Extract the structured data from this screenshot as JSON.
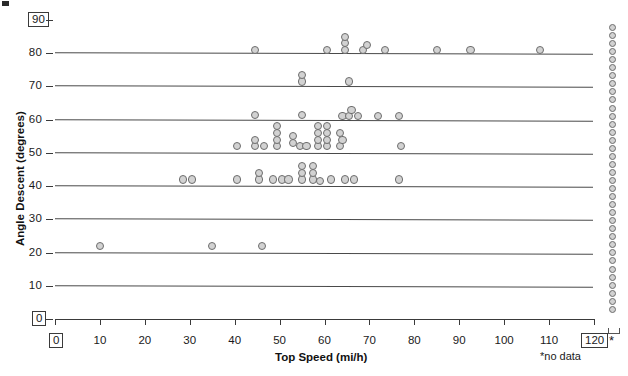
{
  "chart_data": {
    "type": "scatter",
    "title": "",
    "xlabel": "Top Speed (mi/h)",
    "ylabel": "Angle Descent (degrees)",
    "xlim": [
      0,
      120
    ],
    "ylim": [
      0,
      90
    ],
    "xticks": [
      0,
      10,
      20,
      30,
      40,
      50,
      60,
      70,
      80,
      90,
      100,
      110,
      120
    ],
    "yticks": [
      0,
      10,
      20,
      30,
      40,
      50,
      60,
      70,
      80,
      90
    ],
    "grid": "horizontal",
    "legend": "none",
    "annotations": [
      "*no data"
    ],
    "boxed_ticks": {
      "x": [
        0,
        120
      ],
      "y": [
        0,
        90
      ]
    },
    "marker": {
      "shape": "circle",
      "fill": "#d2d2d2",
      "edge": "#6d6d6d"
    },
    "points": [
      {
        "x": 10,
        "y": 22
      },
      {
        "x": 35,
        "y": 22
      },
      {
        "x": 46,
        "y": 22
      },
      {
        "x": 28.5,
        "y": 42
      },
      {
        "x": 30.5,
        "y": 42
      },
      {
        "x": 40.5,
        "y": 42
      },
      {
        "x": 45.5,
        "y": 42
      },
      {
        "x": 45.5,
        "y": 44
      },
      {
        "x": 48.5,
        "y": 42
      },
      {
        "x": 50.5,
        "y": 42
      },
      {
        "x": 52,
        "y": 42
      },
      {
        "x": 55,
        "y": 42
      },
      {
        "x": 55,
        "y": 44
      },
      {
        "x": 55,
        "y": 46
      },
      {
        "x": 57.5,
        "y": 42
      },
      {
        "x": 57.5,
        "y": 44
      },
      {
        "x": 57.5,
        "y": 46
      },
      {
        "x": 59,
        "y": 41.5
      },
      {
        "x": 61.5,
        "y": 42
      },
      {
        "x": 64.5,
        "y": 42
      },
      {
        "x": 66.5,
        "y": 42
      },
      {
        "x": 76.5,
        "y": 42
      },
      {
        "x": 40.5,
        "y": 52
      },
      {
        "x": 44.5,
        "y": 52
      },
      {
        "x": 44.5,
        "y": 54
      },
      {
        "x": 46.5,
        "y": 52
      },
      {
        "x": 49.5,
        "y": 52
      },
      {
        "x": 49.5,
        "y": 54
      },
      {
        "x": 49.5,
        "y": 56
      },
      {
        "x": 49.5,
        "y": 58
      },
      {
        "x": 53,
        "y": 53
      },
      {
        "x": 53,
        "y": 55
      },
      {
        "x": 54.5,
        "y": 52
      },
      {
        "x": 56,
        "y": 52
      },
      {
        "x": 58.5,
        "y": 52
      },
      {
        "x": 58.5,
        "y": 54
      },
      {
        "x": 58.5,
        "y": 56
      },
      {
        "x": 58.5,
        "y": 58
      },
      {
        "x": 60.5,
        "y": 52
      },
      {
        "x": 60.5,
        "y": 54
      },
      {
        "x": 60.5,
        "y": 56
      },
      {
        "x": 60.5,
        "y": 58
      },
      {
        "x": 63.5,
        "y": 52
      },
      {
        "x": 64,
        "y": 54
      },
      {
        "x": 63.5,
        "y": 56
      },
      {
        "x": 77,
        "y": 52
      },
      {
        "x": 44.5,
        "y": 61.5
      },
      {
        "x": 55,
        "y": 61.5
      },
      {
        "x": 64,
        "y": 61
      },
      {
        "x": 65.5,
        "y": 61
      },
      {
        "x": 66,
        "y": 63
      },
      {
        "x": 67.5,
        "y": 61
      },
      {
        "x": 72,
        "y": 61
      },
      {
        "x": 76.5,
        "y": 61
      },
      {
        "x": 55,
        "y": 71.5
      },
      {
        "x": 55,
        "y": 73.5
      },
      {
        "x": 65.5,
        "y": 71.5
      },
      {
        "x": 44.5,
        "y": 81
      },
      {
        "x": 60.5,
        "y": 81
      },
      {
        "x": 64.5,
        "y": 81
      },
      {
        "x": 64.5,
        "y": 83
      },
      {
        "x": 64.5,
        "y": 85
      },
      {
        "x": 68.5,
        "y": 81
      },
      {
        "x": 69.5,
        "y": 82.5
      },
      {
        "x": 73.5,
        "y": 81
      },
      {
        "x": 85,
        "y": 81
      },
      {
        "x": 92.5,
        "y": 81
      },
      {
        "x": 108,
        "y": 81
      }
    ],
    "no_data_column": {
      "label": "*",
      "note": "*no data",
      "count": 36,
      "description": "stacked circles column outside the plot at right marked with asterisk"
    }
  }
}
